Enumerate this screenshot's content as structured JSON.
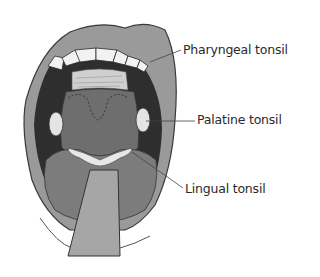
{
  "diagram": {
    "labels": [
      {
        "id": "pharyngeal",
        "text": "Pharyngeal tonsil"
      },
      {
        "id": "palatine",
        "text": "Palatine tonsil"
      },
      {
        "id": "lingual",
        "text": "Lingual tonsil"
      }
    ],
    "colors": {
      "lip": "#9a9a9a",
      "lip_outline": "#3a3a3a",
      "teeth": "#f2f2f2",
      "cavity_dark": "#2e2e2e",
      "pharynx": "#6e6e6e",
      "tongue": "#7c7c7c",
      "tongue_depressor": "#a6a6a6",
      "tonsil": "#e4e4e4",
      "leader_line": "#444444",
      "label_text": "#2a2a2a"
    }
  }
}
